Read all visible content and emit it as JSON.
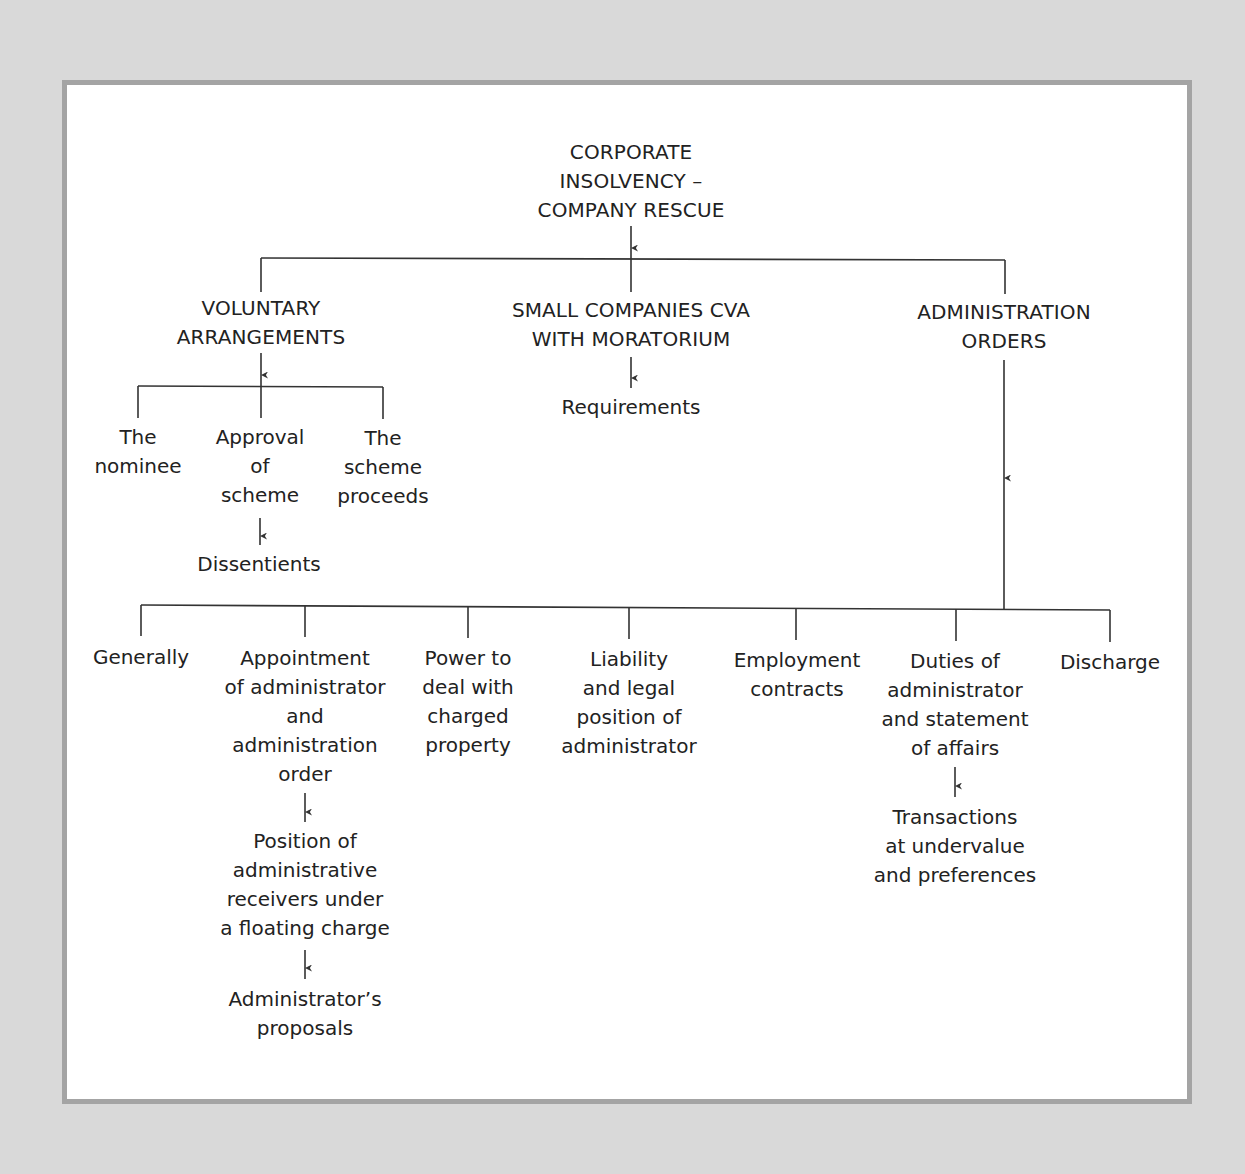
{
  "diagram": {
    "root": {
      "label": "CORPORATE\nINSOLVENCY –\nCOMPANY RESCUE"
    },
    "branches": [
      {
        "label": "VOLUNTARY\nARRANGEMENTS",
        "children": [
          {
            "label": "The\nnominee"
          },
          {
            "label": "Approval\nof\nscheme",
            "child": {
              "label": "Dissentients"
            }
          },
          {
            "label": "The\nscheme\nproceeds"
          }
        ]
      },
      {
        "label": "SMALL COMPANIES CVA\nWITH MORATORIUM",
        "child": {
          "label": "Requirements"
        }
      },
      {
        "label": "ADMINISTRATION\nORDERS",
        "children": [
          {
            "label": "Generally"
          },
          {
            "label": "Appointment\nof administrator\nand\nadministration\norder",
            "child": {
              "label": "Position of\nadministrative\nreceivers under\na floating charge",
              "child": {
                "label": "Administrator’s\nproposals"
              }
            }
          },
          {
            "label": "Power to\ndeal with\ncharged\nproperty"
          },
          {
            "label": "Liability\nand legal\nposition of\nadministrator"
          },
          {
            "label": "Employment\ncontracts"
          },
          {
            "label": "Duties of\nadministrator\nand statement\nof affairs",
            "child": {
              "label": "Transactions\nat undervalue\nand preferences"
            }
          },
          {
            "label": "Discharge"
          }
        ]
      }
    ]
  },
  "colors": {
    "background": "#d9d9d9",
    "frame_border": "#a4a4a4",
    "panel": "#ffffff",
    "line": "#333333",
    "text": "#222222"
  }
}
